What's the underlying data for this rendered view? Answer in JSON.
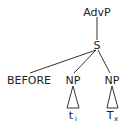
{
  "tree": {
    "root": "AdvP",
    "s_node": "S",
    "before": "BEFORE",
    "np_left": "NP",
    "np_right": "NP",
    "leaf_left": {
      "base": "t",
      "sub": "i"
    },
    "leaf_right": {
      "base": "T",
      "sub": "x"
    }
  }
}
